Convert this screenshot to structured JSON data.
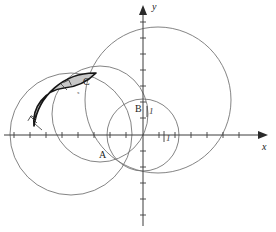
{
  "figure": {
    "kind": "geometry-diagram",
    "background_color": "#ffffff",
    "stroke_color": "#6e6e6e",
    "emphasis_stroke_color": "#1c1c1c",
    "axis_color": "#3c3c3c",
    "shade_fill_color": "#c9c9c9",
    "width": 276,
    "height": 232
  },
  "axes": {
    "x_axis": {
      "name": "x",
      "label": "x",
      "label_x": 262,
      "label_y": 147,
      "y_pixel": 135,
      "start_x": 4,
      "end_x": 268,
      "arrow": "right",
      "ticks_px": [
        14,
        30,
        46,
        62,
        78,
        94,
        110,
        126,
        158,
        174,
        190,
        206,
        222,
        238
      ],
      "tick_half_len": 3
    },
    "y_axis": {
      "name": "y",
      "label": "y",
      "label_x": 152,
      "label_y": 4,
      "x_pixel": 143,
      "start_y": 226,
      "end_y": 6,
      "arrow": "up",
      "ticks_px": [
        22,
        38,
        54,
        70,
        86,
        102,
        118,
        150,
        166,
        182,
        198,
        214
      ],
      "tick_half_len": 3
    },
    "origin": {
      "x": 143,
      "y": 135
    },
    "unit_px": 16
  },
  "circles": [
    {
      "name": "large-right-circle",
      "cx": 158,
      "cy": 100,
      "r": 73,
      "stroke": "#767676",
      "stroke_width": 0.9,
      "fill": "none"
    },
    {
      "name": "lower-left-circle",
      "cx": 71,
      "cy": 134,
      "r": 61,
      "stroke": "#767676",
      "stroke_width": 0.9,
      "fill": "none"
    },
    {
      "name": "middle-circle",
      "cx": 100,
      "cy": 114,
      "r": 48,
      "stroke": "#767676",
      "stroke_width": 0.9,
      "fill": "none"
    },
    {
      "name": "small-right-circle",
      "cx": 143,
      "cy": 135,
      "r": 36,
      "stroke": "#767676",
      "stroke_width": 0.9,
      "fill": "none"
    }
  ],
  "shaded_region": {
    "name": "lune-shaded-area",
    "fill": "#c8c8c8",
    "fill_opacity": 1,
    "outline_stroke": "#151515",
    "outline_width": 1.7,
    "path": "M 34 126 A 61 61 0 0 1 96 73 A 51 51 0 0 1 64 88 A 34 34 0 0 0 34 126 Z",
    "vertex_start": {
      "x": 34,
      "y": 126
    },
    "vertex_top": {
      "x": 96,
      "y": 73
    },
    "vertex_inner": {
      "x": 64,
      "y": 88
    }
  },
  "point_labels": [
    {
      "name": "label-A",
      "text": "A",
      "x": 99,
      "y": 150
    },
    {
      "name": "label-B",
      "text": "B",
      "x": 135,
      "y": 107
    },
    {
      "name": "label-C",
      "text": "C",
      "x": 83,
      "y": 81
    }
  ],
  "unit_labels": [
    {
      "name": "unit-label-vertical",
      "text": "1",
      "x": 148,
      "y": 111
    },
    {
      "name": "unit-label-horizontal",
      "text": "1",
      "x": 165,
      "y": 136
    }
  ],
  "tiny_marks": [
    {
      "name": "tiny-x-mark-near-c",
      "text": "x",
      "x": 78,
      "y": 93
    }
  ],
  "right_angle_marks": [
    {
      "name": "right-angle-mark-at-c",
      "x": 64,
      "y": 88,
      "rotation": -28,
      "size": 6
    },
    {
      "name": "right-angle-mark-at-left",
      "x": 34,
      "y": 126,
      "rotation": -62,
      "size": 6
    }
  ],
  "intersection_ticks": [
    {
      "name": "tick-cross-upper",
      "x": 33,
      "y": 120
    },
    {
      "name": "tick-cross-lower",
      "x": 38,
      "y": 128
    }
  ]
}
